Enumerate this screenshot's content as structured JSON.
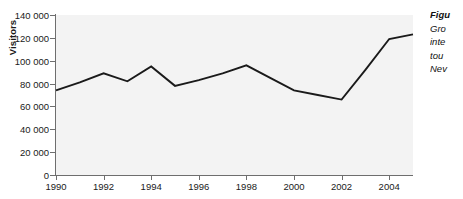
{
  "chart_data": {
    "type": "line",
    "title": "",
    "xlabel": "",
    "ylabel": "Visitors",
    "xlim": [
      1990,
      2005
    ],
    "ylim": [
      0,
      140000
    ],
    "grid": false,
    "legend": "none",
    "x_tick_labels": [
      "1990",
      "1992",
      "1994",
      "1996",
      "1998",
      "2000",
      "2002",
      "2004"
    ],
    "x_tick_values": [
      1990,
      1992,
      1994,
      1996,
      1998,
      2000,
      2002,
      2004
    ],
    "y_tick_labels": [
      "0",
      "20 000",
      "40 000",
      "60 000",
      "80 000",
      "100 000",
      "120 000",
      "140 000"
    ],
    "y_tick_values": [
      0,
      20000,
      40000,
      60000,
      80000,
      100000,
      120000,
      140000
    ],
    "x": [
      1990,
      1991,
      1992,
      1993,
      1994,
      1995,
      1996,
      1997,
      1998,
      1999,
      2000,
      2001,
      2002,
      2003,
      2004,
      2005
    ],
    "values": [
      74000,
      81000,
      89000,
      82000,
      95000,
      78000,
      83000,
      89000,
      96000,
      85000,
      74000,
      70000,
      66000,
      92000,
      119000,
      123000
    ],
    "series": [
      {
        "name": "Visitors",
        "values": [
          74000,
          81000,
          89000,
          82000,
          95000,
          78000,
          83000,
          89000,
          96000,
          85000,
          74000,
          70000,
          66000,
          92000,
          119000,
          123000
        ]
      }
    ],
    "line_color": "#1a1a1a",
    "plot_background": "#f3f3f3",
    "axis_color": "#6e6e6e"
  },
  "caption": {
    "title": "Figu",
    "lines": [
      "Gro",
      "inte",
      "tou",
      "Nev"
    ]
  }
}
